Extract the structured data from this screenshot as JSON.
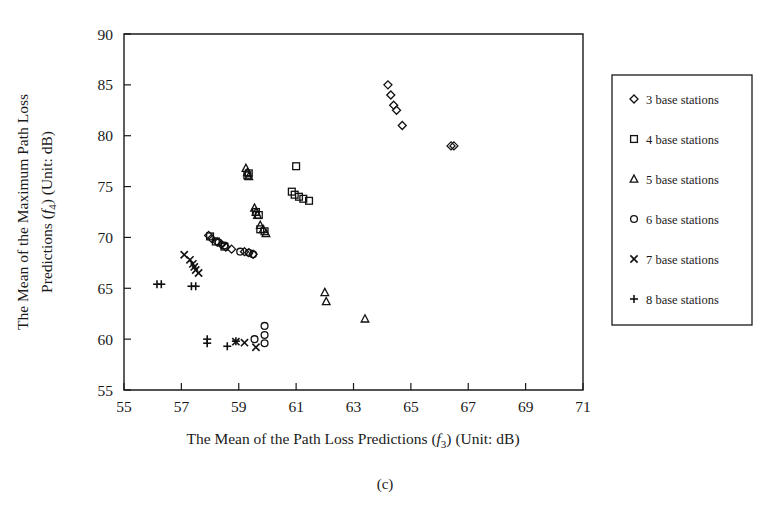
{
  "figure": {
    "caption": "(c)",
    "background": "#ffffff",
    "marker_color": "#111111"
  },
  "chart_data": {
    "type": "scatter",
    "title": "",
    "xlabel": "The Mean of the Path Loss Predictions (f3) (Unit: dB)",
    "ylabel": "The Mean of the Maximum Path Loss Predictions (f4) (Unit: dB)",
    "xlabel_parts": {
      "pre": "The Mean of the Path Loss Predictions (",
      "sym": "f",
      "sub": "3",
      "post": ") (Unit: dB)"
    },
    "ylabel_parts": {
      "line1_pre": "The Mean of the Maximum Path Loss",
      "line2_pre": "Predictions (",
      "sym": "f",
      "sub": "4",
      "post": ") (Unit: dB)"
    },
    "xlim": [
      55,
      71
    ],
    "ylim": [
      55,
      90
    ],
    "xticks": [
      55,
      57,
      59,
      61,
      63,
      65,
      67,
      69,
      71
    ],
    "yticks": [
      55,
      60,
      65,
      70,
      75,
      80,
      85,
      90
    ],
    "grid": false,
    "legend_position": "right-outside",
    "series": [
      {
        "name": "3 base stations",
        "marker": "diamond",
        "points": [
          [
            57.95,
            70.2
          ],
          [
            58.05,
            69.9
          ],
          [
            58.25,
            69.55
          ],
          [
            58.4,
            69.3
          ],
          [
            58.55,
            69.05
          ],
          [
            58.75,
            68.85
          ],
          [
            59.35,
            68.5
          ],
          [
            59.5,
            68.35
          ],
          [
            59.2,
            68.6
          ],
          [
            64.2,
            85.0
          ],
          [
            64.3,
            84.0
          ],
          [
            64.4,
            83.0
          ],
          [
            64.5,
            82.5
          ],
          [
            64.7,
            81.0
          ],
          [
            66.4,
            79.0
          ],
          [
            66.5,
            79.0
          ]
        ]
      },
      {
        "name": "4 base stations",
        "marker": "square",
        "points": [
          [
            61.0,
            77.0
          ],
          [
            60.85,
            74.5
          ],
          [
            60.95,
            74.2
          ],
          [
            61.1,
            74.0
          ],
          [
            61.25,
            73.8
          ],
          [
            61.45,
            73.6
          ],
          [
            59.3,
            76.1
          ],
          [
            59.35,
            76.3
          ],
          [
            59.6,
            72.5
          ],
          [
            59.7,
            72.2
          ],
          [
            59.75,
            70.8
          ],
          [
            59.9,
            70.6
          ],
          [
            58.0,
            70.1
          ],
          [
            58.2,
            69.6
          ],
          [
            58.5,
            69.1
          ]
        ]
      },
      {
        "name": "5 base stations",
        "marker": "triangle",
        "points": [
          [
            59.25,
            76.8
          ],
          [
            59.3,
            76.4
          ],
          [
            59.35,
            76.0
          ],
          [
            59.55,
            72.9
          ],
          [
            59.6,
            72.5
          ],
          [
            59.65,
            72.2
          ],
          [
            59.75,
            71.2
          ],
          [
            59.85,
            70.8
          ],
          [
            59.95,
            70.4
          ],
          [
            62.0,
            64.6
          ],
          [
            62.05,
            63.7
          ],
          [
            63.4,
            62.0
          ]
        ]
      },
      {
        "name": "6 base stations",
        "marker": "circle",
        "points": [
          [
            59.05,
            68.6
          ],
          [
            59.35,
            68.5
          ],
          [
            59.5,
            68.35
          ],
          [
            58.3,
            69.5
          ],
          [
            58.5,
            69.2
          ],
          [
            59.9,
            61.3
          ],
          [
            59.9,
            60.4
          ],
          [
            59.9,
            59.6
          ],
          [
            59.55,
            60.0
          ]
        ]
      },
      {
        "name": "7 base stations",
        "marker": "cross",
        "points": [
          [
            57.1,
            68.3
          ],
          [
            57.3,
            67.8
          ],
          [
            57.4,
            67.4
          ],
          [
            57.45,
            67.1
          ],
          [
            57.5,
            66.8
          ],
          [
            57.6,
            66.5
          ],
          [
            58.9,
            59.75
          ],
          [
            59.2,
            59.65
          ],
          [
            59.6,
            59.2
          ]
        ]
      },
      {
        "name": "8 base stations",
        "marker": "plus",
        "points": [
          [
            56.15,
            65.4
          ],
          [
            56.3,
            65.4
          ],
          [
            57.35,
            65.2
          ],
          [
            57.5,
            65.2
          ],
          [
            57.9,
            60.0
          ],
          [
            57.9,
            59.6
          ],
          [
            58.6,
            59.3
          ],
          [
            58.9,
            59.8
          ]
        ]
      }
    ]
  },
  "legend": {
    "entries": [
      {
        "label": "3 base stations",
        "marker": "diamond"
      },
      {
        "label": "4 base stations",
        "marker": "square"
      },
      {
        "label": "5 base stations",
        "marker": "triangle"
      },
      {
        "label": "6 base stations",
        "marker": "circle"
      },
      {
        "label": "7 base stations",
        "marker": "cross"
      },
      {
        "label": "8 base stations",
        "marker": "plus"
      }
    ]
  }
}
